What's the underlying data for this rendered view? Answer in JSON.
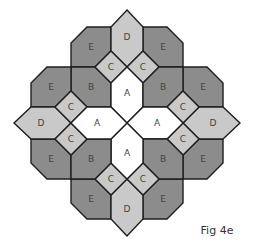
{
  "figure": {
    "caption": "Fig 4e",
    "center": [
      127,
      123
    ],
    "tile_types": {
      "A": {
        "label": "A",
        "fill": "#ffffff"
      },
      "B": {
        "label": "B",
        "fill": "#8c8c8c"
      },
      "C": {
        "label": "C",
        "fill": "#c9c9c9"
      },
      "D": {
        "label": "D",
        "fill": "#c9c9c9"
      },
      "E": {
        "label": "E",
        "fill": "#8c8c8c"
      }
    },
    "tile_counts": {
      "A": 4,
      "B": 4,
      "C": 8,
      "D": 4,
      "E": 8
    },
    "stroke_color": "#1e1e1e"
  }
}
